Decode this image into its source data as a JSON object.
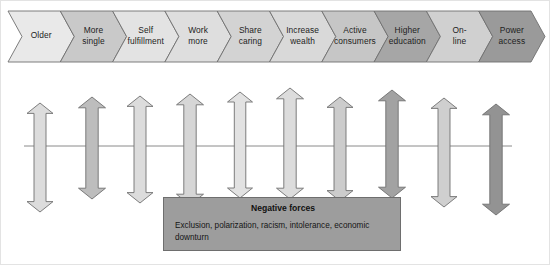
{
  "figure": {
    "background_color": "#ffffff",
    "border_color": "#e3e3e3"
  },
  "chevron_band": {
    "name": "trend-chevron-band",
    "y_top": 11,
    "y_bottom": 62,
    "x_start": 8,
    "x_end": 545,
    "outline_color": "#6f6f6f",
    "items": [
      {
        "label": "Older",
        "fill": "#e9e9e9"
      },
      {
        "label": "More\nsingle",
        "fill": "#c9c9c9"
      },
      {
        "label": "Self\nfulfillment",
        "fill": "#e3e3e3"
      },
      {
        "label": "Work\nmore",
        "fill": "#dedede"
      },
      {
        "label": "Share\ncaring",
        "fill": "#d3d3d3"
      },
      {
        "label": "Increase\nwealth",
        "fill": "#d9d9d9"
      },
      {
        "label": "Active\nconsumers",
        "fill": "#c6c6c6"
      },
      {
        "label": "Higher\neducation",
        "fill": "#a6a6a6"
      },
      {
        "label": "On-\nline",
        "fill": "#d0d0d0"
      },
      {
        "label": "Power\naccess",
        "fill": "#9a9a9a"
      }
    ]
  },
  "axis_line": {
    "name": "horizontal-axis-line",
    "x_start": 24,
    "x_end": 512,
    "y": 146,
    "color": "#8a8a8a"
  },
  "arrows": {
    "name": "double-headed-force-arrows",
    "outline_color": "#6f6f6f",
    "items": [
      {
        "index": 1,
        "cx": 40,
        "top": 103,
        "bottom": 212,
        "width": 26,
        "fill": "#dcdcdc"
      },
      {
        "index": 2,
        "cx": 92,
        "top": 97,
        "bottom": 199,
        "width": 27,
        "fill": "#bdbdbd"
      },
      {
        "index": 3,
        "cx": 140,
        "top": 96,
        "bottom": 203,
        "width": 26,
        "fill": "#dcdcdc"
      },
      {
        "index": 4,
        "cx": 190,
        "top": 94,
        "bottom": 205,
        "width": 27,
        "fill": "#d6d6d6"
      },
      {
        "index": 5,
        "cx": 240,
        "top": 92,
        "bottom": 198,
        "width": 25,
        "fill": "#e2e2e2"
      },
      {
        "index": 6,
        "cx": 290,
        "top": 88,
        "bottom": 199,
        "width": 27,
        "fill": "#dcdcdc"
      },
      {
        "index": 7,
        "cx": 340,
        "top": 97,
        "bottom": 201,
        "width": 26,
        "fill": "#cccccc"
      },
      {
        "index": 8,
        "cx": 392,
        "top": 90,
        "bottom": 198,
        "width": 27,
        "fill": "#a2a2a2"
      },
      {
        "index": 9,
        "cx": 444,
        "top": 98,
        "bottom": 207,
        "width": 26,
        "fill": "#cfcfcf"
      },
      {
        "index": 10,
        "cx": 496,
        "top": 104,
        "bottom": 215,
        "width": 27,
        "fill": "#939393"
      }
    ]
  },
  "negative_forces": {
    "name": "negative-forces-box",
    "title": "Negative forces",
    "body": "Exclusion, polarization, racism, intolerance, economic downturn",
    "fill": "#9d9d9d",
    "border": "#6e6e6e"
  }
}
